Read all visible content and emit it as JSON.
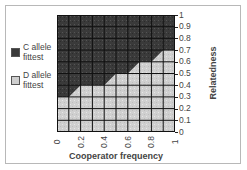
{
  "chart_data": {
    "type": "heatmap",
    "title": "",
    "xlabel": "Cooperator frequency",
    "ylabel": "Relatedness",
    "x_ticks": [
      "0",
      "0.2",
      "0.4",
      "0.6",
      "0.8",
      "1"
    ],
    "y_ticks": [
      "0",
      "0.1",
      "0.2",
      "0.3",
      "0.4",
      "0.5",
      "0.6",
      "0.7",
      "0.8",
      "0.9",
      "1"
    ],
    "xlim": [
      0,
      1
    ],
    "ylim": [
      0,
      1
    ],
    "grid": true,
    "grid_cells": [
      10,
      10
    ],
    "legend": [
      {
        "label": "C allele fittest",
        "color": "#3a3a3a"
      },
      {
        "label": "D allele fittest",
        "color": "#cfcfcf"
      }
    ],
    "legend_position": "left",
    "boundary": {
      "description": "Relatedness threshold above which C allele is fittest, per cooperator-frequency column (0.1 wide)",
      "columns_x_start": [
        0,
        0.1,
        0.2,
        0.3,
        0.4,
        0.5,
        0.6,
        0.7,
        0.8,
        0.9
      ],
      "threshold_left": [
        0.3,
        0.3,
        0.4,
        0.4,
        0.4,
        0.5,
        0.5,
        0.6,
        0.6,
        0.7
      ],
      "threshold_right": [
        0.3,
        0.4,
        0.4,
        0.4,
        0.5,
        0.5,
        0.6,
        0.6,
        0.7,
        0.7
      ]
    }
  },
  "legend": {
    "c_label_line1": "C allele",
    "c_label_line2": "fittest",
    "d_label_line1": "D allele",
    "d_label_line2": "fittest"
  },
  "axes": {
    "xlabel": "Cooperator frequency",
    "ylabel": "Relatedness",
    "y_ticks": [
      "1",
      "0.9",
      "0.8",
      "0.7",
      "0.6",
      "0.5",
      "0.4",
      "0.3",
      "0.2",
      "0.1",
      "0"
    ],
    "x_ticks": [
      "0",
      "0.2",
      "0.4",
      "0.6",
      "0.8",
      "1"
    ]
  },
  "colors": {
    "c_region": "#3a3a3a",
    "d_region": "#cfcfcf",
    "grid": "#111111"
  }
}
